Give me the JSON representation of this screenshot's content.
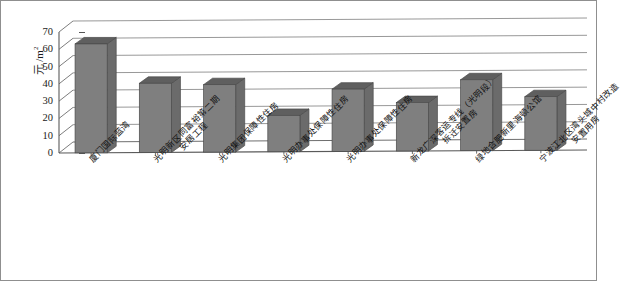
{
  "chart_data": {
    "type": "bar",
    "title": "",
    "subtitle": "",
    "xlabel": "",
    "ylabel": "元 /m²",
    "ylabel_unit": "元 /m",
    "ylabel_sup": "2",
    "ylim": [
      0,
      70
    ],
    "ytick_step": 10,
    "yticks": [
      "70",
      "60",
      "50",
      "40",
      "30",
      "20",
      "10",
      "0"
    ],
    "grid": true,
    "grid_axis": "y",
    "legend": "none",
    "style": "3d-perspective-column",
    "bar_color": "#7f7f7f",
    "bar_top_color": "#5f5f5f",
    "bar_side_color": "#6b6b6b",
    "categories": [
      "厦门国际蓝湾",
      "光明新区同富裕第二期安居工程",
      "光明集团保障性住房",
      "光明办事处保障性住房",
      "光明办事处保障性住房",
      "新龙广深客运专线（光明段）拆迁安置房",
      "绿地合肥新里海顿公馆",
      "宁波江北区湾头城中村改造安置用房"
    ],
    "category_lines": [
      [
        "厦门国际蓝湾",
        ""
      ],
      [
        "光明新区同富裕第二期",
        "安居工程"
      ],
      [
        "光明集团保障性住房",
        ""
      ],
      [
        "光明办事处保障性住房",
        ""
      ],
      [
        "光明办事处保障性住房",
        ""
      ],
      [
        "新龙广深客运专线（光明段）",
        "拆迁安置房"
      ],
      [
        "绿地合肥新里海顿公馆",
        ""
      ],
      [
        "宁波江北区湾头城中村改造",
        "安置用房"
      ]
    ],
    "values": [
      63,
      40,
      39,
      21,
      36,
      28,
      41,
      31
    ]
  }
}
